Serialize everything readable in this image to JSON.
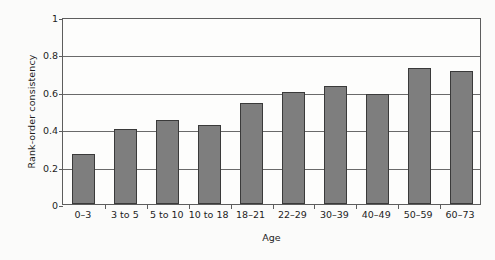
{
  "chart_data": {
    "type": "bar",
    "title": "",
    "xlabel": "Age",
    "ylabel": "Rank-order consistency",
    "categories": [
      "0–3",
      "3 to 5",
      "5 to 10",
      "10 to 18",
      "18–21",
      "22–29",
      "30–39",
      "40–49",
      "50–59",
      "60–73"
    ],
    "values": [
      0.27,
      0.4,
      0.45,
      0.42,
      0.54,
      0.6,
      0.63,
      0.59,
      0.73,
      0.71
    ],
    "ylim": [
      0,
      1
    ],
    "ytick_labels": [
      "0",
      "0.2",
      "0.4",
      "0.6",
      "0.8",
      "1"
    ],
    "ytick_values": [
      0,
      0.2,
      0.4,
      0.6,
      0.8,
      1
    ],
    "grid": "horizontal",
    "legend": "none",
    "bar_color": "#7e7e7e",
    "bar_edge_color": "#3a3a3a",
    "axis_color": "#5d5d5d",
    "grid_color": "#6a6a6a",
    "background_color": "#fdfdfc"
  }
}
